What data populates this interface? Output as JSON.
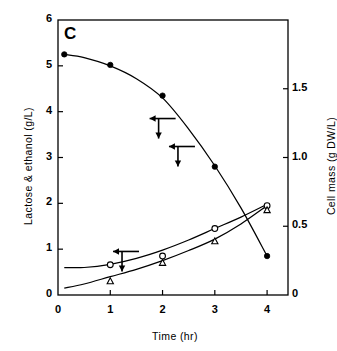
{
  "figure": {
    "panel_label": "C",
    "background": "#ffffff",
    "ink_color": "#000000"
  },
  "chart_data": {
    "type": "line",
    "title": "",
    "subtitle": "",
    "panel": "C",
    "xlabel": "Time (hr)",
    "ylabel": "Lactose & ethanol (g/L)",
    "ylabel_right": "Cell mass (g DW/L)",
    "xlim": [
      0,
      4.4
    ],
    "ylim": [
      0,
      6
    ],
    "ylim_right": [
      0,
      2
    ],
    "xticks": [
      0,
      1,
      2,
      3,
      4
    ],
    "xticklabels": [
      "0",
      "1",
      "2",
      "3",
      "4"
    ],
    "yticks": [
      0,
      1,
      2,
      3,
      4,
      5,
      6
    ],
    "yticklabels": [
      "0",
      "1",
      "2",
      "3",
      "4",
      "5",
      "6"
    ],
    "yticks_right": [
      0,
      0.5,
      1.0,
      1.5
    ],
    "yticklabels_right": [
      "0",
      "0.5",
      "1.0",
      "1.5"
    ],
    "grid": false,
    "legend": "none",
    "frame": "box",
    "annotations": [
      {
        "name": "arrow-left-axis-lactose",
        "x": 2.25,
        "y": 3.85,
        "direction": "left-then-down",
        "axis": "left"
      },
      {
        "name": "arrow-left-axis-ethanol",
        "x": 1.55,
        "y": 0.95,
        "direction": "left-then-down",
        "axis": "left"
      },
      {
        "name": "arrow-right-axis-cellmass",
        "x": 2.62,
        "y": 1.08,
        "direction": "left-then-down",
        "axis": "right"
      }
    ],
    "series": [
      {
        "name": "Lactose",
        "marker": "filled-circle",
        "axis": "left",
        "x": [
          0.12,
          1.0,
          2.0,
          3.0,
          4.0
        ],
        "values": [
          5.25,
          5.02,
          4.35,
          2.8,
          0.85
        ],
        "curve_x": [
          0.12,
          0.5,
          1.0,
          1.5,
          2.0,
          2.5,
          3.0,
          3.5,
          4.0
        ],
        "curve_y": [
          5.25,
          5.18,
          5.0,
          4.72,
          4.3,
          3.62,
          2.82,
          1.9,
          0.85
        ]
      },
      {
        "name": "Ethanol",
        "marker": "open-circle",
        "axis": "left",
        "x": [
          1.0,
          2.0,
          3.0,
          4.0
        ],
        "values": [
          0.66,
          0.85,
          1.45,
          1.95
        ],
        "curve_x": [
          0.12,
          0.5,
          1.0,
          1.5,
          2.0,
          2.5,
          3.0,
          3.5,
          4.0
        ],
        "curve_y": [
          0.6,
          0.6,
          0.67,
          0.8,
          0.98,
          1.2,
          1.45,
          1.7,
          1.98
        ]
      },
      {
        "name": "Cell mass",
        "marker": "open-triangle",
        "axis": "right",
        "x": [
          1.0,
          2.0,
          3.0,
          4.0
        ],
        "values_right_axis": [
          0.1,
          0.23,
          0.39,
          0.62
        ],
        "values_left_axis_units": [
          0.3,
          0.7,
          1.17,
          1.85
        ],
        "curve_x": [
          0.12,
          0.5,
          1.0,
          1.5,
          2.0,
          2.5,
          3.0,
          3.5,
          4.0
        ],
        "curve_y_left_units": [
          0.15,
          0.24,
          0.4,
          0.56,
          0.75,
          0.97,
          1.22,
          1.55,
          1.95
        ]
      }
    ]
  }
}
